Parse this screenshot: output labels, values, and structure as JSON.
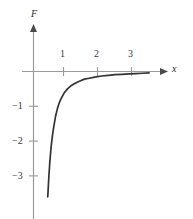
{
  "chart_data": {
    "type": "line",
    "title": "",
    "xlabel": "x",
    "ylabel": "F",
    "xlim": [
      -0.1,
      3.6
    ],
    "ylim": [
      -3.6,
      0.35
    ],
    "xticks": [
      1,
      2,
      3
    ],
    "xtick_labels": [
      "1",
      "2",
      "3"
    ],
    "yticks": [
      -1,
      -2,
      -3
    ],
    "ytick_labels": [
      "−1",
      "−2",
      "−3"
    ],
    "grid": false,
    "legend": null,
    "axis_arrows": [
      "x-positive",
      "y-positive"
    ],
    "series": [
      {
        "name": "F(x)",
        "description": "negative hyperbolic decay approaching zero from below, vertical asymptote near x = 0.38",
        "x": [
          0.42,
          0.45,
          0.48,
          0.52,
          0.56,
          0.6,
          0.65,
          0.7,
          0.75,
          0.8,
          0.9,
          1.0,
          1.1,
          1.2,
          1.3,
          1.4,
          1.5,
          1.6,
          1.8,
          2.0,
          2.2,
          2.4,
          2.6,
          2.8,
          3.0,
          3.2,
          3.4
        ],
        "y": [
          -3.6,
          -3.05,
          -2.6,
          -2.15,
          -1.82,
          -1.56,
          -1.28,
          -1.08,
          -0.92,
          -0.8,
          -0.62,
          -0.5,
          -0.41,
          -0.35,
          -0.3,
          -0.26,
          -0.22,
          -0.2,
          -0.16,
          -0.13,
          -0.11,
          -0.09,
          -0.08,
          -0.07,
          -0.06,
          -0.05,
          -0.04
        ]
      }
    ]
  },
  "style": {
    "curve_color": "#333333",
    "axis_color": "#9a9a9a",
    "tick_color": "#9a9a9a",
    "label_color": "#3a3a3a",
    "background": "#ffffff"
  },
  "labels": {
    "y_axis": "F",
    "x_axis": "x",
    "x_tick_1": "1",
    "x_tick_2": "2",
    "x_tick_3": "3",
    "y_tick_1": "−1",
    "y_tick_2": "−2",
    "y_tick_3": "−3"
  }
}
